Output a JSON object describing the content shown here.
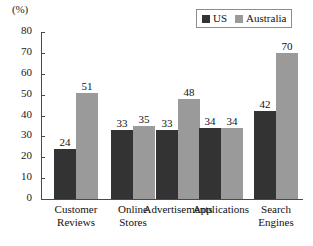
{
  "chart_data": {
    "type": "bar",
    "title": "",
    "subtitle": "",
    "xlabel": "",
    "ylabel": "(%)",
    "ylim": [
      0,
      80
    ],
    "ytick_step": 10,
    "yticks": [
      0,
      10,
      20,
      30,
      40,
      50,
      60,
      70,
      80
    ],
    "grid": false,
    "legend_position": "top-right",
    "categories": [
      "Customer Reviews",
      "Online Stores",
      "Advertisements",
      "Applications",
      "Search Engines"
    ],
    "category_lines": [
      [
        "Customer",
        "Reviews"
      ],
      [
        "Online",
        "Stores"
      ],
      [
        "Advertisements"
      ],
      [
        "Applications"
      ],
      [
        "Search",
        "Engines"
      ]
    ],
    "series": [
      {
        "name": "US",
        "color": "#333333",
        "values": [
          24,
          33,
          33,
          34,
          42
        ]
      },
      {
        "name": "Australia",
        "color": "#9a9a9a",
        "values": [
          51,
          35,
          48,
          34,
          70
        ]
      }
    ],
    "data_labels": {
      "US": [
        "24",
        "33",
        "33",
        "34",
        "42"
      ],
      "Australia": [
        "51",
        "35",
        "48",
        "34",
        "70"
      ]
    },
    "axis_unit_label": "(%)"
  },
  "legend": {
    "entries": [
      {
        "label": "US",
        "swatch": "#333333",
        "icon": "square-swatch-dark"
      },
      {
        "label": "Australia",
        "swatch": "#9a9a9a",
        "icon": "square-swatch-gray"
      }
    ]
  },
  "colors": {
    "axis": "#4a4a4a",
    "text": "#111111",
    "background": "#ffffff",
    "series_us": "#333333",
    "series_australia": "#9a9a9a",
    "legend_border": "#8d8d8d"
  }
}
